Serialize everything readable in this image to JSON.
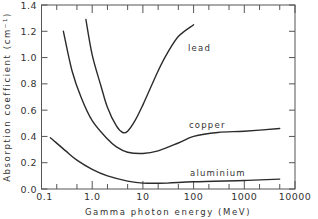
{
  "chart_data": {
    "type": "line",
    "title": "",
    "xlabel": "Gamma photon energy (MeV)",
    "ylabel": "Absorption coefficient (cm-1)",
    "xscale": "log",
    "xlim": [
      0.1,
      10000
    ],
    "ylim": [
      0.0,
      1.4
    ],
    "grid": false,
    "legend": "none (curves labelled inline)",
    "x_tick_labels": [
      "0.1",
      "1.0",
      "10",
      "100",
      "1000",
      "10000"
    ],
    "y_tick_labels": [
      "0.0",
      "0.2",
      "0.4",
      "0.6",
      "0.8",
      "1.0",
      "1.2",
      "1.4"
    ],
    "series": [
      {
        "name": "lead",
        "label": "lead",
        "x": [
          0.75,
          1.0,
          1.5,
          2.0,
          3.0,
          4.0,
          5.0,
          7.0,
          10,
          20,
          30,
          50,
          100
        ],
        "y": [
          1.29,
          1.02,
          0.78,
          0.62,
          0.48,
          0.43,
          0.44,
          0.52,
          0.64,
          0.9,
          1.03,
          1.16,
          1.25
        ]
      },
      {
        "name": "copper",
        "label": "copper",
        "x": [
          0.27,
          0.4,
          0.6,
          1.0,
          2.0,
          3.0,
          5.0,
          10,
          20,
          50,
          100,
          300,
          1000,
          5000
        ],
        "y": [
          1.2,
          0.9,
          0.7,
          0.52,
          0.38,
          0.32,
          0.28,
          0.27,
          0.29,
          0.35,
          0.4,
          0.43,
          0.44,
          0.46
        ]
      },
      {
        "name": "aluminium",
        "label": "aluminium",
        "x": [
          0.15,
          0.3,
          0.5,
          1.0,
          2.0,
          5.0,
          10,
          30,
          100,
          1000,
          5000
        ],
        "y": [
          0.39,
          0.29,
          0.22,
          0.15,
          0.1,
          0.06,
          0.045,
          0.045,
          0.055,
          0.065,
          0.075
        ]
      }
    ]
  },
  "labels": {
    "ylabel": "Absorption coefficient (cm⁻¹)",
    "xlabel": "Gamma photon energy (MeV)",
    "lead": "lead",
    "copper": "copper",
    "aluminium": "aluminium"
  }
}
